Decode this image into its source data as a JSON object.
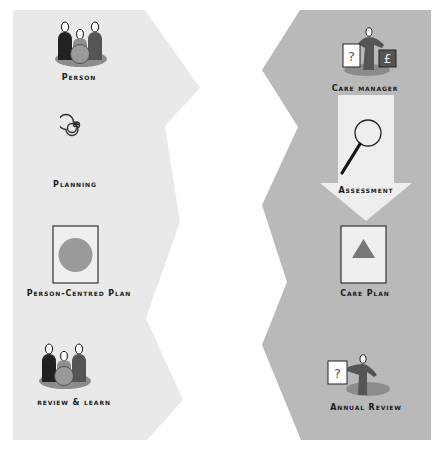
{
  "diagram": {
    "colors": {
      "left_panel": "#e9e9e9",
      "right_panel": "#b9b9b9",
      "arrow": "#eeeeee",
      "figure_dark": "#222222",
      "figure_mid": "#8f8f8f",
      "figure_dark2": "#555555",
      "shadow": "#8c8c8c",
      "circle_fill": "#9a9a9a",
      "triangle_fill": "#777777",
      "pound_box": "#555555"
    },
    "left_column": {
      "name": "Person-centred path",
      "steps": [
        {
          "id": "person",
          "label": "Person",
          "icon": "group-of-people-icon"
        },
        {
          "id": "planning",
          "label": "Planning",
          "icon": "spiral-icon"
        },
        {
          "id": "pcp",
          "label": "Person-Centred Plan",
          "icon": "document-circle-icon"
        },
        {
          "id": "review",
          "label": "review & learn",
          "icon": "group-of-people-icon"
        }
      ]
    },
    "right_column": {
      "name": "Care management path",
      "steps": [
        {
          "id": "care_manager",
          "label": "Care manager",
          "icon": "presenter-question-pound-icon"
        },
        {
          "id": "assessment",
          "label": "Assessment",
          "icon": "magnifying-glass-icon"
        },
        {
          "id": "care_plan",
          "label": "Care Plan",
          "icon": "document-triangle-icon"
        },
        {
          "id": "annual_review",
          "label": "Annual Review",
          "icon": "presenter-question-icon"
        }
      ]
    },
    "symbols": {
      "question": "?",
      "pound": "£"
    }
  }
}
